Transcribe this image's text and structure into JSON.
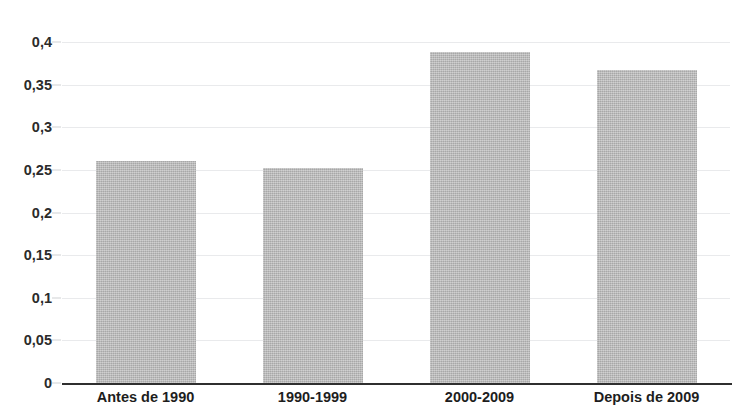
{
  "chart_data": {
    "type": "bar",
    "title": "",
    "xlabel": "",
    "ylabel": "",
    "categories": [
      "Antes de 1990",
      "1990-1999",
      "2000-2009",
      "Depois de 2009"
    ],
    "values": [
      0.26,
      0.252,
      0.388,
      0.367
    ],
    "ylim": [
      0,
      0.4
    ],
    "ytick_labels": [
      "0",
      "0,05",
      "0,1",
      "0,15",
      "0,2",
      "0,25",
      "0,3",
      "0,35",
      "0,4"
    ],
    "ytick_values": [
      0,
      0.05,
      0.1,
      0.15,
      0.2,
      0.25,
      0.3,
      0.35,
      0.4
    ],
    "grid": true,
    "legend": false,
    "decimal_separator": ",",
    "series": [
      {
        "name": "",
        "values": [
          0.26,
          0.252,
          0.388,
          0.367
        ]
      }
    ],
    "colors": {
      "bar_fill": "#b9b9b9",
      "gridline": "#e9eaec",
      "axis_line": "#2f2f2f",
      "tick_text": "#1d1d1d",
      "background": "#ffffff"
    }
  }
}
